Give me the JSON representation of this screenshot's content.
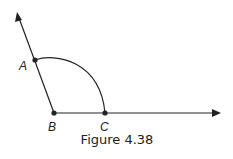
{
  "figure": {
    "caption": "Figure 4.38",
    "points": {
      "A": {
        "label": "A",
        "x": 35,
        "y": 60
      },
      "B": {
        "label": "B",
        "x": 54,
        "y": 113
      },
      "C": {
        "label": "C",
        "x": 105,
        "y": 113
      }
    },
    "rays": [
      {
        "from": "B",
        "through": "A",
        "tip": {
          "x": 17,
          "y": 12
        }
      },
      {
        "from": "B",
        "through": "C",
        "tip": {
          "x": 221,
          "y": 113
        }
      }
    ],
    "arc": {
      "center": "B",
      "from": "A",
      "to": "C"
    },
    "colors": {
      "stroke": "#222222",
      "background": "#ffffff"
    }
  }
}
